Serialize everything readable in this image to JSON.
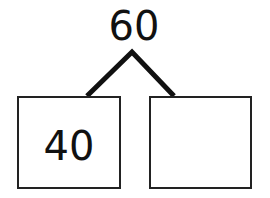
{
  "number_bond": {
    "whole": "60",
    "parts": [
      {
        "value": "40"
      },
      {
        "value": ""
      }
    ]
  }
}
